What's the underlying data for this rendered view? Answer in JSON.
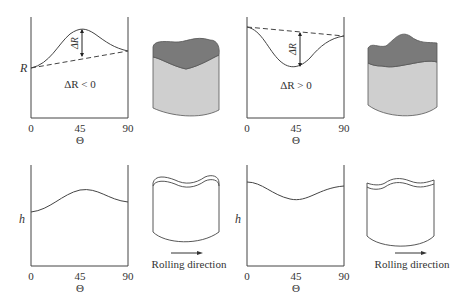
{
  "panels": {
    "top_left": {
      "y_label": "R",
      "x_label": "Θ",
      "x_ticks": [
        "0",
        "45",
        "90"
      ],
      "annotation": "ΔR < 0",
      "delta_label": "ΔR"
    },
    "top_right": {
      "x_label": "Θ",
      "x_ticks": [
        "0",
        "45",
        "90"
      ],
      "annotation": "ΔR > 0",
      "delta_label": "ΔR"
    },
    "bottom_left": {
      "y_label": "h",
      "x_label": "Θ",
      "x_ticks": [
        "0",
        "45",
        "90"
      ],
      "caption": "Rolling direction"
    },
    "bottom_right": {
      "y_label": "h",
      "x_label": "Θ",
      "x_ticks": [
        "0",
        "45",
        "90"
      ],
      "caption": "Rolling direction"
    }
  },
  "colors": {
    "cup_dark": "#7a7a7a",
    "cup_light": "#cfcfcf",
    "line": "#444444"
  }
}
